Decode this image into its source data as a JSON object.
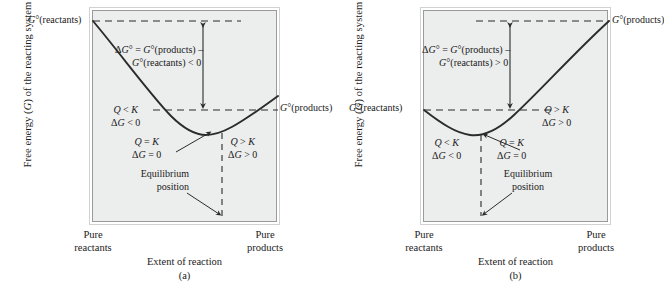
{
  "figure": {
    "axis_y_label": "Free energy (G) of the reacting system",
    "axis_x_label": "Extent of reaction",
    "axis_x_left": "Pure\nreactants",
    "axis_x_left_line1": "Pure",
    "axis_x_left_line2": "reactants",
    "axis_x_right_line1": "Pure",
    "axis_x_right_line2": "products",
    "equilibrium_label_line1": "Equilibrium",
    "equilibrium_label_line2": "position",
    "colors": {
      "plot_background": "#eceded",
      "page_background": "#ffffff",
      "curve": "#2b2b2b",
      "frame_inner": "#9a9a9a",
      "frame_outer": "#d2d2d2",
      "text": "#1a1a1a"
    }
  },
  "panels": [
    {
      "id": "a",
      "caption": "(a)",
      "start_label": "G°(reactants)",
      "end_label": "G°(products)",
      "delta_g_line1": "ΔG° = G°(products) –",
      "delta_g_line2": "G°(reactants) < 0",
      "delta_g_sign": "< 0",
      "region_left_line1": "Q < K",
      "region_left_line2": "ΔG < 0",
      "region_eq_line1": "Q = K",
      "region_eq_line2": "ΔG = 0",
      "region_right_line1": "Q > K",
      "region_right_line2": "ΔG > 0",
      "equilibrium_line1": "Equilibrium",
      "equilibrium_line2": "position"
    },
    {
      "id": "b",
      "caption": "(b)",
      "start_label": "G°(reactants)",
      "end_label": "G°(products)",
      "delta_g_line1": "ΔG° = G°(products) –",
      "delta_g_line2": "G°(reactants) > 0",
      "delta_g_sign": "> 0",
      "region_left_line1": "Q < K",
      "region_left_line2": "ΔG < 0",
      "region_eq_line1": "Q = K",
      "region_eq_line2": "ΔG = 0",
      "region_right_line1": "Q > K",
      "region_right_line2": "ΔG > 0",
      "equilibrium_line1": "Equilibrium",
      "equilibrium_line2": "position"
    }
  ],
  "chart_data": {
    "type": "line",
    "xlabel": "Extent of reaction",
    "ylabel": "Free energy (G) of the reacting system",
    "xlim": [
      0,
      1
    ],
    "ylim": [
      0,
      1
    ],
    "grid": false,
    "legend": "none",
    "axis_tick_labels_x": [
      "Pure reactants",
      "Pure products"
    ],
    "series": [
      {
        "name": "(a) exothermic: K > 1, equilibrium near products",
        "x": [
          0.0,
          0.1,
          0.2,
          0.3,
          0.4,
          0.5,
          0.6,
          0.7,
          0.78,
          0.85,
          0.92,
          1.0
        ],
        "y": [
          1.0,
          0.89,
          0.78,
          0.68,
          0.59,
          0.5,
          0.43,
          0.37,
          0.345,
          0.35,
          0.38,
          0.44
        ],
        "start_value": 1.0,
        "end_value": 0.44,
        "minimum_x": 0.8,
        "minimum_y": 0.344,
        "delta_g_standard": -0.56
      },
      {
        "name": "(b) endothermic: K < 1, equilibrium near reactants",
        "x": [
          0.0,
          0.08,
          0.15,
          0.22,
          0.3,
          0.4,
          0.5,
          0.6,
          0.7,
          0.8,
          0.9,
          1.0
        ],
        "y": [
          0.44,
          0.38,
          0.35,
          0.344,
          0.36,
          0.42,
          0.5,
          0.6,
          0.71,
          0.82,
          0.92,
          1.0
        ],
        "start_value": 0.44,
        "end_value": 1.0,
        "minimum_x": 0.2,
        "minimum_y": 0.344,
        "delta_g_standard": 0.56
      }
    ],
    "annotations": [
      {
        "panel": "a",
        "text": "G°(reactants)",
        "at_x": 0.0,
        "at_y": 1.0
      },
      {
        "panel": "a",
        "text": "G°(products)",
        "at_x": 1.0,
        "at_y": 0.44
      },
      {
        "panel": "a",
        "text": "ΔG° = G°(products) – G°(reactants) < 0"
      },
      {
        "panel": "a",
        "text": "Q < K, ΔG < 0",
        "region": "left-of-equilibrium"
      },
      {
        "panel": "a",
        "text": "Q = K, ΔG = 0",
        "region": "at-equilibrium"
      },
      {
        "panel": "a",
        "text": "Q > K, ΔG > 0",
        "region": "right-of-equilibrium"
      },
      {
        "panel": "a",
        "text": "Equilibrium position",
        "at_x": 0.8
      },
      {
        "panel": "b",
        "text": "G°(reactants)",
        "at_x": 0.0,
        "at_y": 0.44
      },
      {
        "panel": "b",
        "text": "G°(products)",
        "at_x": 1.0,
        "at_y": 1.0
      },
      {
        "panel": "b",
        "text": "ΔG° = G°(products) – G°(reactants) > 0"
      },
      {
        "panel": "b",
        "text": "Q < K, ΔG < 0",
        "region": "left-of-equilibrium"
      },
      {
        "panel": "b",
        "text": "Q = K, ΔG = 0",
        "region": "at-equilibrium"
      },
      {
        "panel": "b",
        "text": "Q > K, ΔG > 0",
        "region": "right-of-equilibrium"
      },
      {
        "panel": "b",
        "text": "Equilibrium position",
        "at_x": 0.2
      }
    ]
  }
}
